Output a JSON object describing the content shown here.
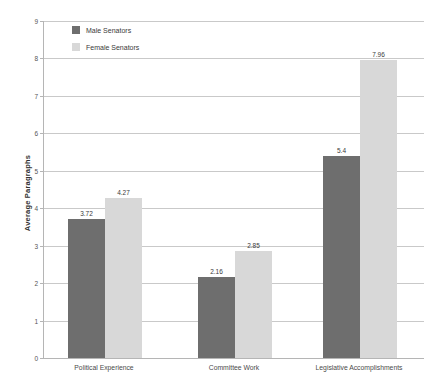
{
  "chart_data": {
    "type": "bar",
    "title": "",
    "subtitle": "",
    "xlabel": "",
    "ylabel": "Average Paragraphs",
    "categories": [
      "Political Experience",
      "Committee Work",
      "Legislative Accomplishments"
    ],
    "series": [
      {
        "name": "Male Senators",
        "color": "#6e6e6e",
        "values": [
          3.72,
          2.16,
          5.4
        ],
        "value_labels": [
          "3.72",
          "2.16",
          "5.4"
        ]
      },
      {
        "name": "Female Senators",
        "color": "#d8d8d8",
        "values": [
          4.27,
          2.85,
          7.96
        ],
        "value_labels": [
          "4.27",
          "2.85",
          "7.96"
        ]
      }
    ],
    "ylim": [
      0,
      9
    ],
    "y_ticks": [
      0,
      1,
      2,
      3,
      4,
      5,
      6,
      7,
      8,
      9
    ],
    "y_tick_labels": [
      "0",
      "1",
      "2",
      "3",
      "4",
      "5",
      "6",
      "7",
      "8",
      "9"
    ],
    "grid": true,
    "grid_axis": "y",
    "grid_color": "#c9c9c9",
    "axis_color": "#b5b5b5",
    "legend_position": "top-left",
    "bar_labels_shown": true,
    "background_color": "#ffffff"
  },
  "legend": {
    "items": [
      {
        "label": "Male Senators",
        "color": "#6e6e6e"
      },
      {
        "label": "Female Senators",
        "color": "#d8d8d8"
      }
    ]
  }
}
